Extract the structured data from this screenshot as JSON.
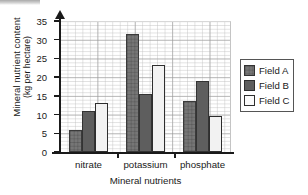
{
  "chart_data": {
    "type": "bar",
    "title": "",
    "xlabel": "Mineral nutrients",
    "ylabel_lines": [
      "Mineral nutrient content",
      "(kg per hectare)"
    ],
    "categories": [
      "nitrate",
      "potassium",
      "phosphate"
    ],
    "series": [
      {
        "name": "Field A",
        "values": [
          6,
          31.5,
          13.5
        ],
        "color": "#767676"
      },
      {
        "name": "Field B",
        "values": [
          11,
          15.5,
          19
        ],
        "color": "#5e5e5e"
      },
      {
        "name": "Field C",
        "values": [
          13,
          23.2,
          9.7
        ],
        "color": "#f2f2f2"
      }
    ],
    "ylim": [
      0,
      35
    ],
    "yticks": [
      0,
      5,
      10,
      15,
      20,
      25,
      30,
      35
    ],
    "ytick_labels": [
      "0",
      "5",
      "10",
      "15",
      "20",
      "25",
      "30",
      "35"
    ],
    "grid": true,
    "grid_minor": true,
    "legend_position": "right"
  },
  "legend": {
    "entries": [
      {
        "label": "Field A",
        "swatch": "field-a-swatch"
      },
      {
        "label": "Field B",
        "swatch": "field-b-swatch"
      },
      {
        "label": "Field C",
        "swatch": "field-c-swatch"
      }
    ]
  }
}
